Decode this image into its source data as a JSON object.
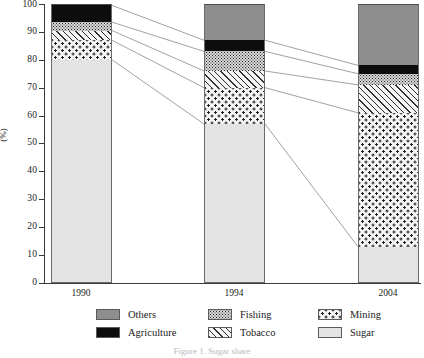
{
  "chart_data": {
    "type": "bar",
    "subtype": "stacked-100-percent",
    "title": "",
    "xlabel": "",
    "ylabel": "(%)",
    "ylim": [
      0,
      100
    ],
    "yticks": [
      0,
      10,
      20,
      30,
      40,
      50,
      60,
      70,
      80,
      90,
      100
    ],
    "ytick_labels": [
      "0",
      "10",
      "20",
      "30",
      "40",
      "50",
      "60",
      "70",
      "80",
      "90",
      "100"
    ],
    "grid": false,
    "legend_position": "bottom",
    "categories": [
      "1990",
      "1994",
      "2004"
    ],
    "series": [
      {
        "name": "Sugar",
        "pattern": "light-gray-solid",
        "values": [
          80,
          57,
          13
        ]
      },
      {
        "name": "Mining",
        "pattern": "coarse-dots",
        "values": [
          7,
          13,
          48
        ]
      },
      {
        "name": "Tobacco",
        "pattern": "diagonal-hatch",
        "values": [
          3.5,
          6,
          10
        ]
      },
      {
        "name": "Fishing",
        "pattern": "fine-speckle",
        "values": [
          3,
          7,
          4
        ]
      },
      {
        "name": "Agriculture",
        "pattern": "black-solid",
        "values": [
          6,
          4,
          3
        ]
      },
      {
        "name": "Others",
        "pattern": "mid-gray-solid",
        "values": [
          0.5,
          13,
          22
        ]
      }
    ],
    "cumulative_tops": {
      "1990": {
        "Sugar": 80,
        "Mining": 87,
        "Tobacco": 90.5,
        "Fishing": 93.5,
        "Agriculture": 99.5,
        "Others": 100
      },
      "1994": {
        "Sugar": 57,
        "Mining": 70,
        "Tobacco": 76,
        "Fishing": 83,
        "Agriculture": 87,
        "Others": 100
      },
      "2004": {
        "Sugar": 13,
        "Mining": 61,
        "Tobacco": 71,
        "Fishing": 75,
        "Agriculture": 78,
        "Others": 100
      }
    },
    "connector_lines": true
  },
  "axis": {
    "y_title": "(%)",
    "y_labels": [
      "100",
      "90",
      "80",
      "70",
      "60",
      "50",
      "40",
      "30",
      "20",
      "10",
      "0"
    ],
    "x_labels": [
      "1990",
      "1994",
      "2004"
    ]
  },
  "legend": {
    "items": [
      {
        "label": "Others",
        "key": "others",
        "swatch": "mid-gray-solid"
      },
      {
        "label": "Fishing",
        "key": "fishing",
        "swatch": "fine-speckle"
      },
      {
        "label": "Mining",
        "key": "mining",
        "swatch": "coarse-dots"
      },
      {
        "label": "Agriculture",
        "key": "agriculture",
        "swatch": "black-solid"
      },
      {
        "label": "Tobacco",
        "key": "tobacco",
        "swatch": "diagonal-hatch"
      },
      {
        "label": "Sugar",
        "key": "sugar",
        "swatch": "light-gray-solid"
      }
    ]
  },
  "caption": "Figure 1. Sugar share",
  "colors": {
    "others": "#8e8e8e",
    "agriculture": "#0d0d0d",
    "fishing": "#d8d8d8",
    "tobacco": "#f2f2f2",
    "mining": "#f4f4f4",
    "sugar": "#e3e3e3",
    "axis": "#3a3a3a",
    "text": "#1a1a1a"
  }
}
